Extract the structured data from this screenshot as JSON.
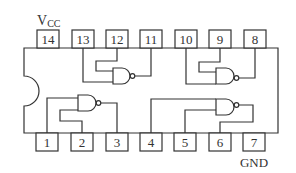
{
  "diagram": {
    "type": "ic-pinout",
    "colors": {
      "line": "#333333",
      "background": "#ffffff"
    },
    "labels": {
      "vcc_main": "V",
      "vcc_sub": "CC",
      "gnd": "GND"
    },
    "top_pins": [
      {
        "number": "14",
        "x": 37
      },
      {
        "number": "13",
        "x": 72
      },
      {
        "number": "12",
        "x": 106
      },
      {
        "number": "11",
        "x": 140
      },
      {
        "number": "10",
        "x": 175
      },
      {
        "number": "9",
        "x": 209
      },
      {
        "number": "8",
        "x": 244
      }
    ],
    "bottom_pins": [
      {
        "number": "1",
        "x": 36
      },
      {
        "number": "2",
        "x": 71
      },
      {
        "number": "3",
        "x": 106
      },
      {
        "number": "4",
        "x": 140
      },
      {
        "number": "5",
        "x": 174
      },
      {
        "number": "6",
        "x": 209
      },
      {
        "number": "7",
        "x": 243
      }
    ],
    "gates": [
      {
        "name": "gate-1",
        "inputs": [
          "13",
          "12"
        ],
        "output": "11"
      },
      {
        "name": "gate-2",
        "inputs": [
          "10",
          "9"
        ],
        "output": "8"
      },
      {
        "name": "gate-3",
        "inputs": [
          "1",
          "2"
        ],
        "output": "3"
      },
      {
        "name": "gate-4",
        "inputs": [
          "4",
          "5"
        ],
        "output": "6"
      }
    ]
  }
}
